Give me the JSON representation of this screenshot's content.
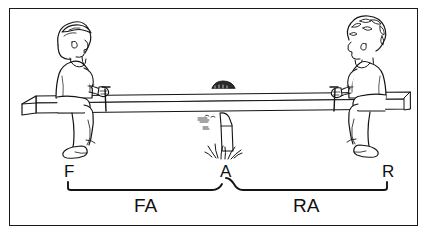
{
  "diagram": {
    "type": "line-drawing",
    "border_color": "#1a1a1a",
    "ink_color": "#101010",
    "background_color": "#ffffff",
    "points": [
      {
        "id": "F",
        "label": "F",
        "meaning": "force-end-left",
        "x": 68,
        "y": 172
      },
      {
        "id": "A",
        "label": "A",
        "meaning": "axis-fulcrum-center",
        "x": 226,
        "y": 172
      },
      {
        "id": "R",
        "label": "R",
        "meaning": "resistance-end-right",
        "x": 388,
        "y": 172
      }
    ],
    "braces": [
      {
        "id": "FA",
        "label": "FA",
        "meaning": "force-arm",
        "from": "F",
        "to": "A",
        "x1": 68,
        "x2": 226,
        "y": 188
      },
      {
        "id": "RA",
        "label": "RA",
        "meaning": "resistance-arm",
        "from": "A",
        "to": "R",
        "x1": 226,
        "x2": 388,
        "y": 188
      }
    ],
    "figures": [
      {
        "id": "left-person",
        "seat_side": "left",
        "facing": "right",
        "hair": "straight"
      },
      {
        "id": "right-person",
        "seat_side": "right",
        "facing": "left",
        "hair": "curly"
      }
    ],
    "plank": {
      "id": "seesaw-plank",
      "x1": 18,
      "x2": 410,
      "y": 104
    },
    "fulcrum": {
      "id": "fulcrum-post",
      "x": 226,
      "y": 130,
      "has_grass": true
    }
  }
}
